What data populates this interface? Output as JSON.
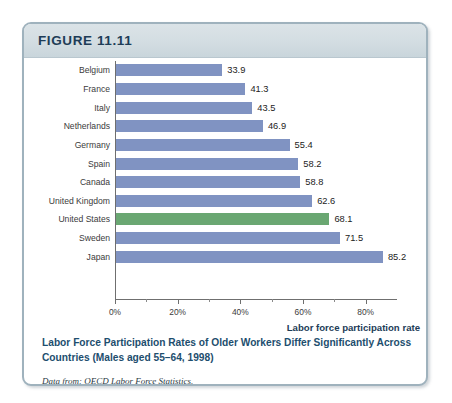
{
  "figure": {
    "header_label": "FIGURE 11.11",
    "caption_title": "Labor Force Participation Rates of Older Workers Differ Significantly Across Countries (Males aged 55–64, 1998)",
    "caption_source": "Data from: OECD Labor Force Statistics."
  },
  "colors": {
    "frame_border": "#9fb2bd",
    "header_band": "#d3dde2",
    "header_text": "#1d3c57",
    "bar_default": "#8093c2",
    "bar_highlight": "#6aa772",
    "caption_text": "#1d4e6e",
    "axis": "#6f6f6f"
  },
  "chart_data": {
    "type": "bar",
    "orientation": "horizontal",
    "title": "Labor Force Participation Rates of Older Workers Differ Significantly Across Countries (Males aged 55–64, 1998)",
    "xlabel": "Labor force participation rate",
    "ylabel": "",
    "xlim": [
      0,
      90
    ],
    "xticks": [
      0,
      20,
      40,
      60,
      80
    ],
    "xtick_labels": [
      "0%",
      "20%",
      "40%",
      "60%",
      "80%"
    ],
    "minor_xticks": [
      10,
      30,
      50,
      70
    ],
    "grid": false,
    "legend": false,
    "categories": [
      "Belgium",
      "France",
      "Italy",
      "Netherlands",
      "Germany",
      "Spain",
      "Canada",
      "United Kingdom",
      "United States",
      "Sweden",
      "Japan"
    ],
    "values": [
      33.9,
      41.3,
      43.5,
      46.9,
      55.4,
      58.2,
      58.8,
      62.6,
      68.1,
      71.5,
      85.2
    ],
    "value_labels": [
      "33.9",
      "41.3",
      "43.5",
      "46.9",
      "55.4",
      "58.2",
      "58.8",
      "62.6",
      "68.1",
      "71.5",
      "85.2"
    ],
    "highlight_index": 8,
    "bars": [
      {
        "label": "Belgium",
        "value": 33.9,
        "display": "33.9",
        "highlight": false
      },
      {
        "label": "France",
        "value": 41.3,
        "display": "41.3",
        "highlight": false
      },
      {
        "label": "Italy",
        "value": 43.5,
        "display": "43.5",
        "highlight": false
      },
      {
        "label": "Netherlands",
        "value": 46.9,
        "display": "46.9",
        "highlight": false
      },
      {
        "label": "Germany",
        "value": 55.4,
        "display": "55.4",
        "highlight": false
      },
      {
        "label": "Spain",
        "value": 58.2,
        "display": "58.2",
        "highlight": false
      },
      {
        "label": "Canada",
        "value": 58.8,
        "display": "58.8",
        "highlight": false
      },
      {
        "label": "United Kingdom",
        "value": 62.6,
        "display": "62.6",
        "highlight": false
      },
      {
        "label": "United States",
        "value": 68.1,
        "display": "68.1",
        "highlight": true
      },
      {
        "label": "Sweden",
        "value": 71.5,
        "display": "71.5",
        "highlight": false
      },
      {
        "label": "Japan",
        "value": 85.2,
        "display": "85.2",
        "highlight": false
      }
    ]
  }
}
